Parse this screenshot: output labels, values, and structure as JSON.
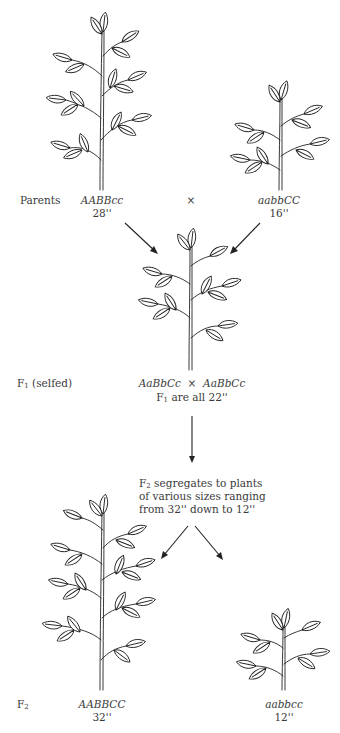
{
  "diagram": {
    "parents": {
      "row_label": "Parents",
      "cross_symbol": "×",
      "left": {
        "genotype": "AABBcc",
        "height": "28''"
      },
      "right": {
        "genotype": "aabbCC",
        "height": "16''"
      }
    },
    "f1": {
      "row_label_main": "F",
      "row_label_sub": "1",
      "row_label_suffix": " (selfed)",
      "cross_left": "AaBbCc",
      "cross_symbol": "×",
      "cross_right": "AaBbCc",
      "note_prefix": "F",
      "note_sub": "1",
      "note_suffix": " are all 22''"
    },
    "f2_note": {
      "line1_prefix": "F",
      "line1_sub": "2",
      "line1_suffix": " segregates to plants",
      "line2": "of various sizes ranging",
      "line3": "from 32'' down to 12''"
    },
    "f2": {
      "row_label_main": "F",
      "row_label_sub": "2",
      "left": {
        "genotype": "AABBCC",
        "height": "32''"
      },
      "right": {
        "genotype": "aabbcc",
        "height": "12''"
      }
    },
    "icons": [
      "plant-tall-icon",
      "plant-short-icon",
      "plant-medium-icon",
      "plant-tallest-icon",
      "plant-shortest-icon",
      "arrow-icon"
    ]
  }
}
